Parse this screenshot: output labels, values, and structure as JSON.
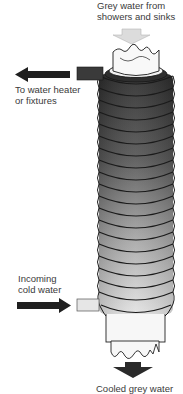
{
  "diagram": {
    "labels": {
      "inlet_top": {
        "line1": "Grey water from",
        "line2": "showers and sinks"
      },
      "outlet_hot": {
        "line1": "To water heater",
        "line2": "or fixtures"
      },
      "inlet_cold": {
        "line1": "Incoming",
        "line2": "cold water"
      },
      "outlet_bottom": {
        "line1": "Cooled grey water"
      }
    },
    "arrows": [
      {
        "name": "grey-water-in-arrow",
        "direction": "down",
        "color": "#d9d9d9"
      },
      {
        "name": "to-heater-arrow",
        "direction": "left",
        "color": "#1f1f1f"
      },
      {
        "name": "cold-water-in-arrow",
        "direction": "right",
        "color": "#1f1f1f"
      },
      {
        "name": "cooled-water-out-arrow",
        "direction": "down",
        "color": "#2a2a2a"
      }
    ],
    "coil": {
      "turns": 19,
      "color_top": "#2b2b2b",
      "color_bottom": "#e2e2e2",
      "outline": "#1a1a1a"
    },
    "colors": {
      "pipe_white": "#f6f6f6",
      "hot_stub": "#3a3a3a",
      "cold_stub": "#e6e6e6"
    }
  }
}
